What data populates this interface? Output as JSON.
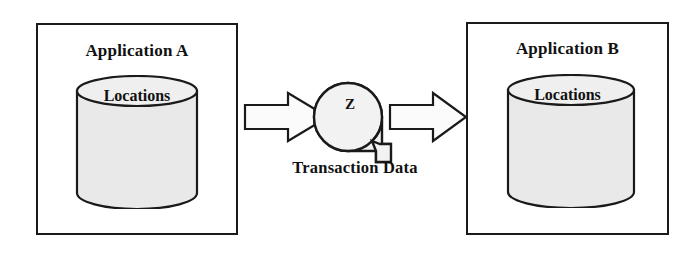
{
  "diagram": {
    "colors": {
      "stroke": "#1a1a1a",
      "cylinder_fill": "#e9e9e9",
      "cylinder_top_fill": "#efefef",
      "arrow_fill": "#fbfbfb",
      "hub_fill": "#f2f2f2",
      "background": "#ffffff"
    },
    "left_app": {
      "title": "Application A",
      "datastore_label": "Locations"
    },
    "right_app": {
      "title": "Application B",
      "datastore_label": "Locations"
    },
    "flow": {
      "hub_label": "Z",
      "caption": "Transaction Data",
      "inbound_arrow_name": "arrow-right-into-hub",
      "outbound_arrow_name": "arrow-right-out-of-hub"
    }
  }
}
